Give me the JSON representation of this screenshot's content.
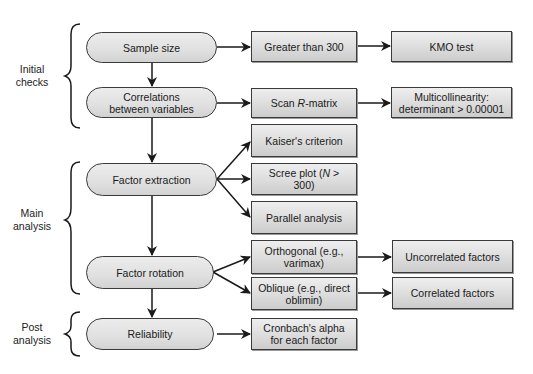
{
  "diagram": {
    "type": "flowchart",
    "title": "",
    "stages": [
      {
        "id": "initial",
        "label_line1": "Initial",
        "label_line2": "checks"
      },
      {
        "id": "main",
        "label_line1": "Main",
        "label_line2": "analysis"
      },
      {
        "id": "post",
        "label_line1": "Post",
        "label_line2": "analysis"
      }
    ],
    "steps": {
      "sample_size": "Sample size",
      "correlations_line1": "Correlations",
      "correlations_line2": "between variables",
      "factor_extraction": "Factor extraction",
      "factor_rotation": "Factor rotation",
      "reliability": "Reliability"
    },
    "outcomes": {
      "greater_than_300": "Greater than 300",
      "kmo_test": "KMO test",
      "scan_prefix": "Scan ",
      "scan_italic": "R",
      "scan_suffix": "-matrix",
      "multicollinearity_line1": "Multicollinearity:",
      "multicollinearity_line2": "determinant > 0.00001",
      "kaiser": "Kaiser's criterion",
      "scree_prefix": "Scree plot (",
      "scree_italic": "N",
      "scree_suffix": " >",
      "scree_line2": "300)",
      "parallel": "Parallel analysis",
      "orthogonal_line1": "Orthogonal (e.g.,",
      "orthogonal_line2": "varimax)",
      "oblique_line1": "Oblique (e.g., direct",
      "oblique_line2": "oblimin)",
      "uncorrelated": "Uncorrelated factors",
      "correlated": "Correlated factors",
      "cronbach_line1": "Cronbach's alpha",
      "cronbach_line2": "for each factor"
    },
    "edges": [
      [
        "Sample size",
        "Greater than 300"
      ],
      [
        "Greater than 300",
        "KMO test"
      ],
      [
        "Sample size",
        "Correlations between variables"
      ],
      [
        "Correlations between variables",
        "Scan R-matrix"
      ],
      [
        "Scan R-matrix",
        "Multicollinearity: determinant > 0.00001"
      ],
      [
        "Correlations between variables",
        "Factor extraction"
      ],
      [
        "Factor extraction",
        "Kaiser's criterion"
      ],
      [
        "Factor extraction",
        "Scree plot (N > 300)"
      ],
      [
        "Factor extraction",
        "Parallel analysis"
      ],
      [
        "Factor extraction",
        "Factor rotation"
      ],
      [
        "Factor rotation",
        "Orthogonal (e.g., varimax)"
      ],
      [
        "Factor rotation",
        "Oblique (e.g., direct oblimin)"
      ],
      [
        "Orthogonal (e.g., varimax)",
        "Uncorrelated factors"
      ],
      [
        "Oblique (e.g., direct oblimin)",
        "Correlated factors"
      ],
      [
        "Factor rotation",
        "Reliability"
      ],
      [
        "Reliability",
        "Cronbach's alpha for each factor"
      ]
    ],
    "colors": {
      "stroke": "#1a1a1a",
      "box_fill": "#dcdcdc",
      "pill_fill": "#e4e4e4",
      "background": "#ffffff"
    }
  }
}
